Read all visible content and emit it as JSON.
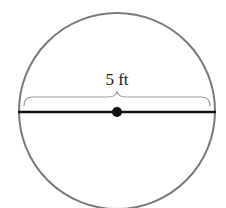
{
  "diagram": {
    "type": "circle-diameter",
    "label": "5 ft",
    "measurement": {
      "value": 5,
      "unit": "ft",
      "refers_to": "diameter"
    },
    "colors": {
      "circle_stroke": "#7a7a7a",
      "diameter_stroke": "#111111",
      "brace_stroke": "#9a9a9a",
      "center_dot": "#111111",
      "background": "#ffffff"
    }
  }
}
